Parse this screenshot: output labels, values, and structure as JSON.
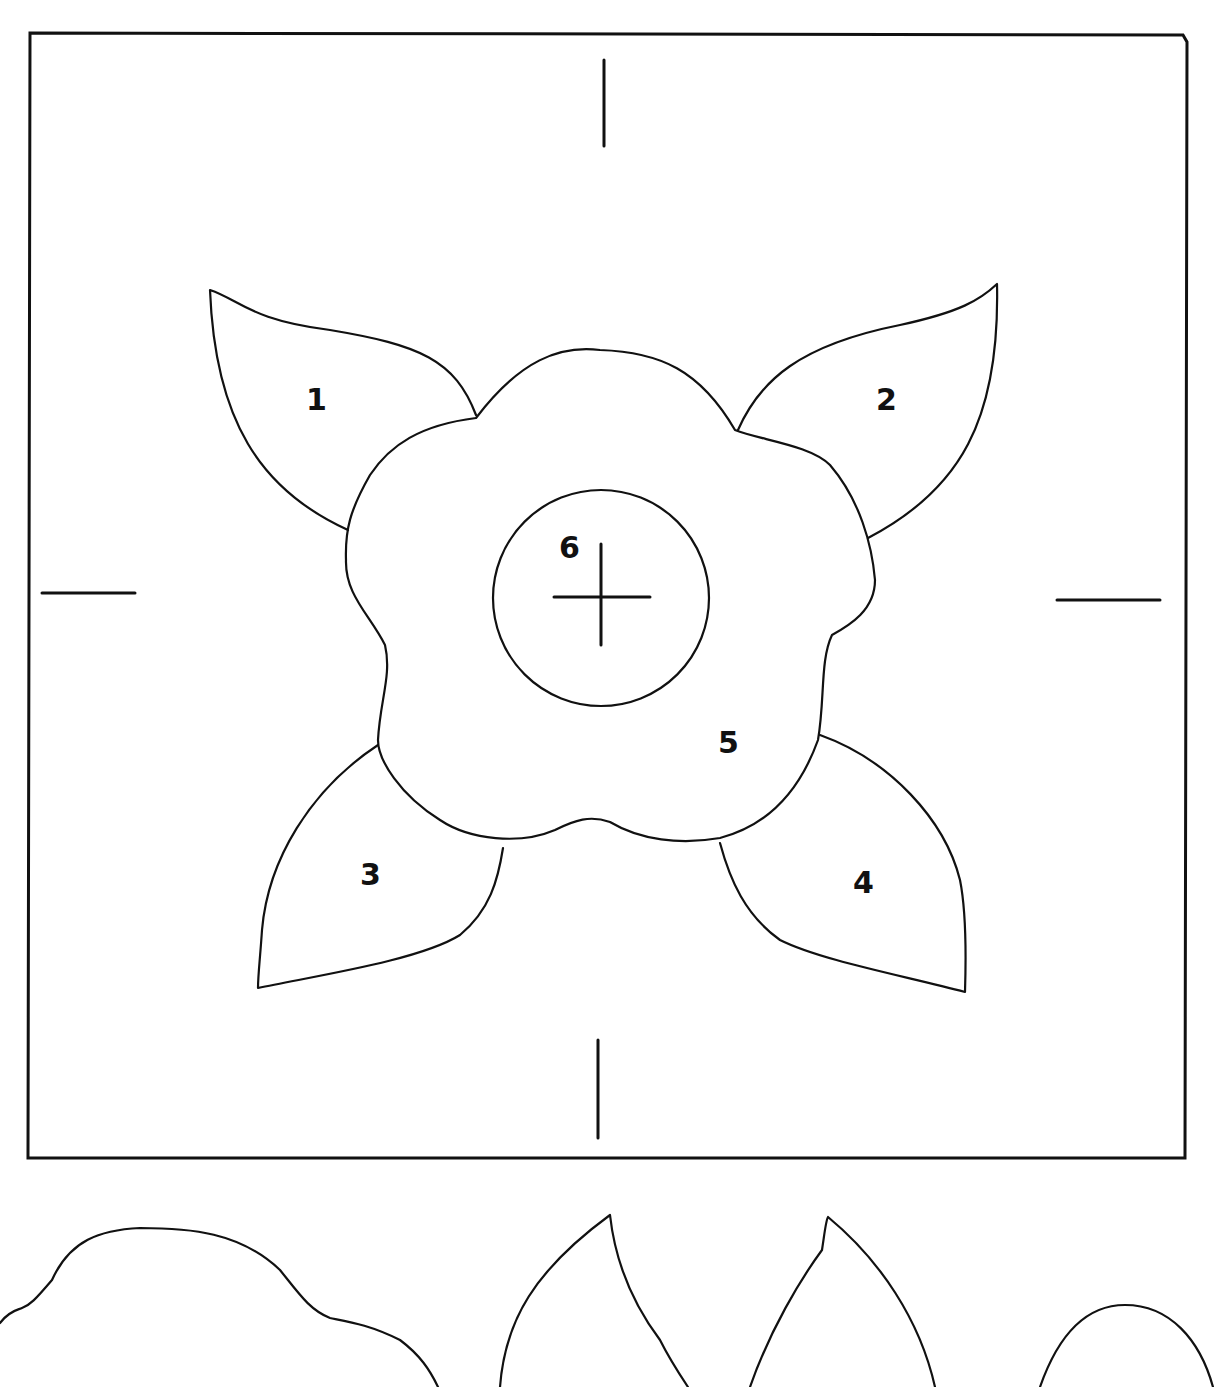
{
  "pattern": {
    "title": "Flower applique block pattern",
    "piece_labels": [
      {
        "id": "1",
        "text": "1",
        "piece": "leaf-top-left",
        "x": 316,
        "y": 410
      },
      {
        "id": "2",
        "text": "2",
        "piece": "leaf-top-right",
        "x": 886,
        "y": 410
      },
      {
        "id": "3",
        "text": "3",
        "piece": "leaf-bottom-left",
        "x": 370,
        "y": 885
      },
      {
        "id": "4",
        "text": "4",
        "piece": "leaf-bottom-right",
        "x": 863,
        "y": 893
      },
      {
        "id": "5",
        "text": "5",
        "piece": "flower-petals",
        "x": 728,
        "y": 753
      },
      {
        "id": "6",
        "text": "6",
        "piece": "flower-center-circle",
        "x": 569,
        "y": 558
      }
    ],
    "icons": {
      "center_mark": "crosshair-icon",
      "registration_marks": "tick-mark-icon"
    },
    "colors": {
      "line": "#111111",
      "background": "#ffffff"
    }
  }
}
